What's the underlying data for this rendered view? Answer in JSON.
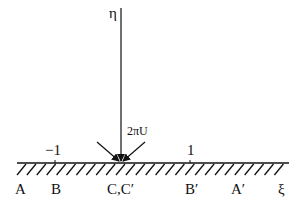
{
  "diagram": {
    "axis_labels": {
      "vertical": "η",
      "horizontal": "ξ"
    },
    "flow_label": "2πU",
    "ticks": [
      {
        "label": "−1",
        "x": 54
      },
      {
        "label": "1",
        "x": 190
      }
    ],
    "points": [
      {
        "label": "A",
        "x": 20
      },
      {
        "label": "B",
        "x": 56
      },
      {
        "label": "C,C′",
        "x": 121
      },
      {
        "label": "B′",
        "x": 191
      },
      {
        "label": "A′",
        "x": 238
      },
      {
        "label": "ξ",
        "x": 283
      }
    ],
    "colors": {
      "line": "#111111",
      "background": "#ffffff"
    }
  }
}
